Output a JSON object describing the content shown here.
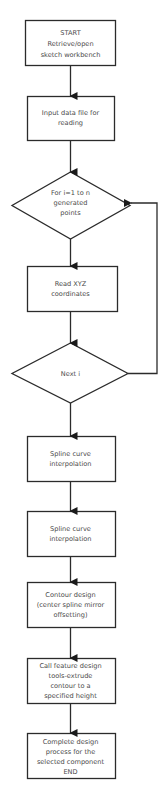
{
  "flowchart": {
    "nodes": [
      {
        "id": "start",
        "shape": "rect",
        "lines": [
          "START",
          "Retrieve/open",
          "sketch workbench"
        ]
      },
      {
        "id": "input",
        "shape": "rect",
        "lines": [
          "Input data file for",
          "reading"
        ]
      },
      {
        "id": "loop",
        "shape": "diamond",
        "lines": [
          "For i=1 to n",
          "generated",
          "points"
        ]
      },
      {
        "id": "read",
        "shape": "rect",
        "lines": [
          "Read XYZ",
          "coordinates"
        ]
      },
      {
        "id": "next",
        "shape": "diamond",
        "lines": [
          "Next i"
        ]
      },
      {
        "id": "spline1",
        "shape": "rect",
        "lines": [
          "Spline curve",
          "interpolation"
        ]
      },
      {
        "id": "spline2",
        "shape": "rect",
        "lines": [
          "Spline curve",
          "interpolation"
        ]
      },
      {
        "id": "contour",
        "shape": "rect",
        "lines": [
          "Contour design",
          "(center spline mirror",
          "offsetting)"
        ]
      },
      {
        "id": "extrude",
        "shape": "rect",
        "lines": [
          "Call feature design",
          "tools-extrude",
          "contour to a",
          "specified height"
        ]
      },
      {
        "id": "end",
        "shape": "rect",
        "lines": [
          "Complete design",
          "process for the",
          "selected component",
          "END"
        ]
      }
    ],
    "edges": [
      {
        "from": "start",
        "to": "input"
      },
      {
        "from": "input",
        "to": "loop"
      },
      {
        "from": "loop",
        "to": "read"
      },
      {
        "from": "read",
        "to": "next"
      },
      {
        "from": "next",
        "to": "loop",
        "type": "loop-back"
      },
      {
        "from": "next",
        "to": "spline1"
      },
      {
        "from": "spline1",
        "to": "spline2"
      },
      {
        "from": "spline2",
        "to": "contour"
      },
      {
        "from": "contour",
        "to": "extrude"
      },
      {
        "from": "extrude",
        "to": "end"
      }
    ],
    "colors": {
      "stroke": "#2b2b2b",
      "text": "#4a4a4a",
      "background": "#ffffff"
    }
  }
}
